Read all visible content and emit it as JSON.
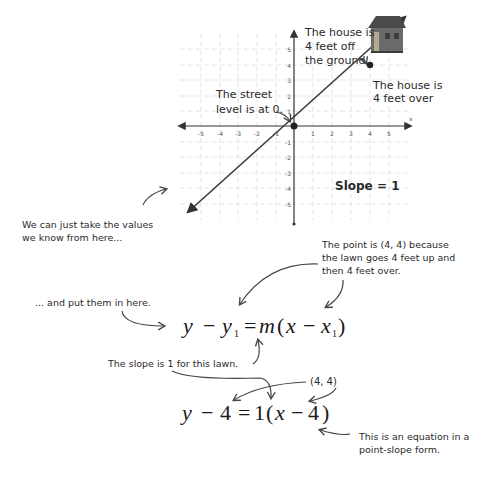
{
  "graph": {
    "x_axis_label": "x",
    "x_ticks": [
      "-5",
      "-4",
      "-3",
      "-2",
      "-1",
      "1",
      "2",
      "3",
      "4",
      "5"
    ],
    "y_ticks": [
      "5",
      "4",
      "3",
      "2",
      "1",
      "-1",
      "-2",
      "-3",
      "-4",
      "-5"
    ],
    "slope_label": "Slope = 1",
    "point_origin": "(0, 0)",
    "point_house": "(4, 4)",
    "house_icon": "house-icon"
  },
  "annotations": {
    "house_height_line1": "The house is",
    "house_height_line2": "4 feet off",
    "house_height_line3": "the ground.",
    "house_over_line1": "The house is",
    "house_over_line2": "4 feet over",
    "street_line1": "The street",
    "street_line2": "level is at 0.",
    "take_values_line1": "We can just take the values",
    "take_values_line2": "we know from here...",
    "point_is_line1": "The point is (4, 4) because",
    "point_is_line2": "the lawn goes 4 feet up and",
    "point_is_line3": "then 4 feet over.",
    "put_here": "... and put them in here.",
    "slope_is": "The slope is 1 for this lawn.",
    "pair": "(4, 4)",
    "eq_form_line1": "This is an equation in a",
    "eq_form_line2": "point-slope form."
  },
  "equations": {
    "general": {
      "y": "y",
      "minus1": "−",
      "y1": "y",
      "sub1": "1",
      "equals": "=",
      "m": "m",
      "open": "(",
      "x": "x",
      "minus2": "−",
      "x1": "x",
      "sub2": "1",
      "close": ")"
    },
    "specific": {
      "y": "y",
      "minus1": "−",
      "y1val": "4",
      "equals": "=",
      "mval": "1",
      "open": "(",
      "x": "x",
      "minus2": "−",
      "x1val": "4",
      "close": ")"
    }
  },
  "colors": {
    "grid": "#e6e6e6",
    "axis": "#333333",
    "line": "#3a3a3a",
    "house_wall": "#6b6b6b",
    "house_roof": "#4a4a4a"
  }
}
